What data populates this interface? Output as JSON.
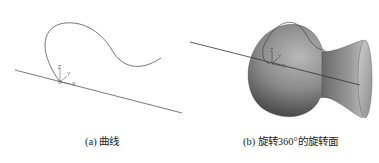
{
  "figure": {
    "panel_a": {
      "caption": "(a) 曲线",
      "axes": {
        "z": "Z",
        "y": "Y",
        "x": "X"
      }
    },
    "panel_b": {
      "caption": "(b) 旋转360°的旋转面",
      "axes": {
        "z": "Z",
        "y": "Y",
        "x": "X"
      }
    }
  }
}
